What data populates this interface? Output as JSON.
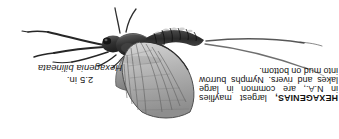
{
  "page": {
    "background_color": "#ffffff",
    "ink_color": "#121212",
    "orientation_note": "text-rotated-180"
  },
  "illustration": {
    "subject": "mayfly",
    "style": "grayscale-engraving",
    "parts": [
      "head",
      "antennae",
      "foreleg",
      "midleg",
      "hindleg",
      "thorax",
      "forewing",
      "hindwing",
      "segmented-abdomen",
      "tail-filament-upper",
      "tail-filament-lower"
    ]
  },
  "species_label": {
    "size": "2.5 in.",
    "scientific_name": "Hexagenia bilineata"
  },
  "description": {
    "heading": "HEXAGENIAS,",
    "lines": [
      [
        "HEXAGENIAS,",
        "largest",
        "mayflies"
      ],
      [
        "in",
        "N.A.,",
        "are",
        "common",
        "in",
        "large"
      ],
      [
        "lakes",
        "and",
        "rivers.",
        "Nymphs",
        "burrow"
      ],
      [
        "into mud on bottom."
      ]
    ],
    "full_text": "HEXAGENIAS, largest mayflies in N.A., are common in large lakes and rivers. Nymphs burrow into mud on bottom."
  }
}
